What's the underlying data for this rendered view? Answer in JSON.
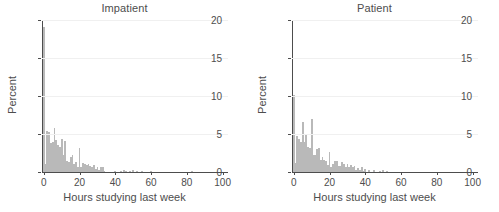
{
  "figure": {
    "background": "#ffffff",
    "bar_color": "#b9b9b9",
    "axis_color": "#4d4d4d",
    "grid_color": "#f0f0f0"
  },
  "chart_data": [
    {
      "type": "bar",
      "title": "Impatient",
      "xlabel": "Hours studying last week",
      "ylabel": "Percent",
      "xlim": [
        -1,
        103
      ],
      "ylim": [
        0,
        20
      ],
      "xticks": [
        0,
        20,
        40,
        60,
        80,
        100
      ],
      "xticklabels": [
        "0",
        "20",
        "40",
        "60",
        "80",
        "100"
      ],
      "yticks": [
        0,
        5,
        10,
        15,
        20
      ],
      "yticklabels": [
        "0",
        "5",
        "10",
        "15",
        "20"
      ],
      "grid": true,
      "legend": "none",
      "bin_width": 1,
      "x": [
        0,
        1,
        2,
        3,
        4,
        5,
        6,
        7,
        8,
        9,
        10,
        11,
        12,
        13,
        14,
        15,
        16,
        17,
        18,
        19,
        20,
        21,
        22,
        23,
        24,
        25,
        26,
        27,
        28,
        29,
        30,
        31,
        32,
        33,
        34,
        35,
        36,
        37,
        38,
        39,
        40,
        41,
        42,
        43,
        44,
        45,
        46,
        47,
        48,
        49,
        50,
        51,
        52,
        53,
        54,
        55,
        56,
        57,
        58,
        59,
        60,
        61,
        62,
        63,
        64,
        65,
        66,
        67,
        68,
        69,
        70,
        71,
        72,
        73,
        74,
        75,
        76,
        77,
        78,
        79,
        80,
        81,
        82,
        83,
        84,
        85
      ],
      "values": [
        19.1,
        1.0,
        5.4,
        5.2,
        3.8,
        4.0,
        5.8,
        4.2,
        3.5,
        3.3,
        4.3,
        2.2,
        4.1,
        1.4,
        1.3,
        2.0,
        2.2,
        1.1,
        1.3,
        0.7,
        3.2,
        0.6,
        1.2,
        1.0,
        0.9,
        1.1,
        0.8,
        0.7,
        0.9,
        0.4,
        0.7,
        0.3,
        0.6,
        0.6,
        0.1,
        0.0,
        0.0,
        0.0,
        0.0,
        0.0,
        0.15,
        0.0,
        0.0,
        0.1,
        0.0,
        0.2,
        0.15,
        0.0,
        0.15,
        0.0,
        0.25,
        0.0,
        0.1,
        0.0,
        0.0,
        0.15,
        0.0,
        0.0,
        0.0,
        0.0,
        0.15,
        0.0,
        0.0,
        0.0,
        0.0,
        0.0,
        0.0,
        0.0,
        0.0,
        0.0,
        0.0,
        0.0,
        0.0,
        0.0,
        0.0,
        0.0,
        0.0,
        0.0,
        0.0,
        0.0,
        0.0,
        0.0,
        0.0,
        0.12,
        0.0,
        0.0
      ]
    },
    {
      "type": "bar",
      "title": "Patient",
      "xlabel": "Hours studying last week",
      "ylabel": "Percent",
      "xlim": [
        -1,
        103
      ],
      "ylim": [
        0,
        20
      ],
      "xticks": [
        0,
        20,
        40,
        60,
        80,
        100
      ],
      "xticklabels": [
        "0",
        "20",
        "40",
        "60",
        "80",
        "100"
      ],
      "yticks": [
        0,
        5,
        10,
        15,
        20
      ],
      "yticklabels": [
        "0",
        "5",
        "10",
        "15",
        "20"
      ],
      "grid": true,
      "legend": "none",
      "bin_width": 1,
      "x": [
        0,
        1,
        2,
        3,
        4,
        5,
        6,
        7,
        8,
        9,
        10,
        11,
        12,
        13,
        14,
        15,
        16,
        17,
        18,
        19,
        20,
        21,
        22,
        23,
        24,
        25,
        26,
        27,
        28,
        29,
        30,
        31,
        32,
        33,
        34,
        35,
        36,
        37,
        38,
        39,
        40,
        41,
        42,
        43,
        44,
        45,
        46,
        47,
        48,
        49,
        50,
        51,
        52
      ],
      "values": [
        10.1,
        1.2,
        4.8,
        4.4,
        4.0,
        6.6,
        3.9,
        5.0,
        3.3,
        3.1,
        7.0,
        2.2,
        2.3,
        3.0,
        3.1,
        1.6,
        2.0,
        1.6,
        1.5,
        0.9,
        2.6,
        0.7,
        1.1,
        1.4,
        1.5,
        0.8,
        0.8,
        1.3,
        1.0,
        0.7,
        1.0,
        0.7,
        0.9,
        0.6,
        0.8,
        0.3,
        0.5,
        0.2,
        0.7,
        0.1,
        0.35,
        0.0,
        0.25,
        0.0,
        0.0,
        0.2,
        0.0,
        0.0,
        0.1,
        0.0,
        0.3,
        0.0,
        0.08
      ]
    }
  ]
}
